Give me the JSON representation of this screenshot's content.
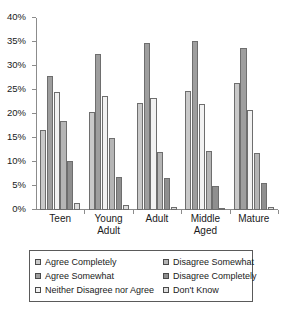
{
  "chart_data": {
    "type": "bar",
    "title": "",
    "subtitle": "",
    "xlabel": "",
    "ylabel": "",
    "ylim": [
      0,
      40
    ],
    "ytick_labels": [
      "0%",
      "5%",
      "10%",
      "15%",
      "20%",
      "25%",
      "30%",
      "35%",
      "40%"
    ],
    "ytick_values": [
      0,
      5,
      10,
      15,
      20,
      25,
      30,
      35,
      40
    ],
    "grid": false,
    "legend_position": "bottom",
    "categories": [
      "Teen",
      "Young Adult",
      "Adult",
      "Middle Aged",
      "Mature"
    ],
    "category_label_lines": [
      [
        "Teen"
      ],
      [
        "Young",
        "Adult"
      ],
      [
        "Adult"
      ],
      [
        "Middle",
        "Aged"
      ],
      [
        "Mature"
      ]
    ],
    "series": [
      {
        "name": "Agree Completely",
        "color": "#c9c9c9",
        "values": [
          16.7,
          20.4,
          22.2,
          24.8,
          26.5
        ]
      },
      {
        "name": "Agree Somewhat",
        "color": "#9e9e9e",
        "values": [
          28.0,
          32.5,
          34.8,
          35.2,
          33.8
        ]
      },
      {
        "name": "Neither Disagree nor Agree",
        "color": "#f2f2f2",
        "values": [
          24.5,
          23.8,
          23.3,
          22.0,
          20.9
        ]
      },
      {
        "name": "Disagree Somewhat",
        "color": "#b5b5b5",
        "values": [
          18.5,
          14.9,
          12.0,
          12.3,
          11.8
        ]
      },
      {
        "name": "Disagree Completely",
        "color": "#8f8f8f",
        "values": [
          10.2,
          6.9,
          6.6,
          5.1,
          5.7
        ]
      },
      {
        "name": "Don't Know",
        "color": "#dedede",
        "values": [
          1.4,
          1.0,
          0.6,
          0.4,
          0.6
        ]
      }
    ]
  },
  "legend": {
    "left_items": [
      "Agree Completely",
      "Agree Somewhat",
      "Neither Disagree nor Agree"
    ],
    "right_items": [
      "Disagree Somewhat",
      "Disagree Completely",
      "Don't Know"
    ]
  }
}
